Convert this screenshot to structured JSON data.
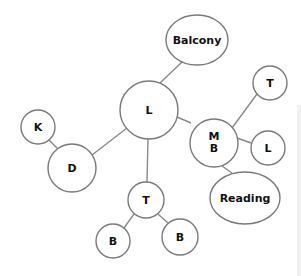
{
  "diagram": {
    "type": "mind-map",
    "colors": {
      "edge": "#8a8a8a",
      "node_stroke": "#7a7a7a",
      "node_fill": "#ffffff",
      "text": "#111111"
    },
    "nodes": {
      "balcony": {
        "label": "Balcony"
      },
      "l_center": {
        "label": "L"
      },
      "mb": {
        "label_line1": "M",
        "label_line2": "B"
      },
      "t_top": {
        "label": "T"
      },
      "l_right": {
        "label": "L"
      },
      "reading": {
        "label": "Reading"
      },
      "k": {
        "label": "K"
      },
      "d": {
        "label": "D"
      },
      "t_bottom": {
        "label": "T"
      },
      "b_left": {
        "label": "B"
      },
      "b_right": {
        "label": "B"
      }
    },
    "edges": [
      [
        "l_center",
        "balcony"
      ],
      [
        "l_center",
        "mb"
      ],
      [
        "l_center",
        "d"
      ],
      [
        "l_center",
        "t_bottom"
      ],
      [
        "mb",
        "t_top"
      ],
      [
        "mb",
        "l_right"
      ],
      [
        "mb",
        "reading"
      ],
      [
        "k",
        "d"
      ],
      [
        "t_bottom",
        "b_left"
      ],
      [
        "t_bottom",
        "b_right"
      ]
    ]
  }
}
